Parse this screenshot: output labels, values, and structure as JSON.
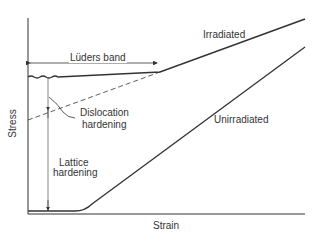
{
  "diagram": {
    "axes": {
      "x_label": "Strain",
      "y_label": "Stress"
    },
    "curves": [
      {
        "name": "Irradiated"
      },
      {
        "name": "Unirradiated"
      }
    ],
    "annotations": {
      "luders_band": "Lüders band",
      "dislocation_hardening": [
        "Dislocation",
        "hardening"
      ],
      "lattice_hardening": [
        "Lattice",
        "hardening"
      ]
    },
    "colors": {
      "line": "#333333",
      "background": "#ffffff"
    }
  }
}
